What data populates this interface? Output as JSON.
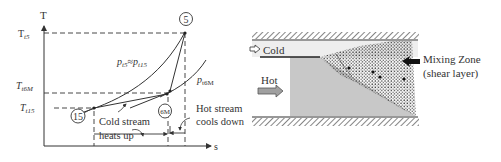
{
  "ts_diagram": {
    "axis_y_label": "T",
    "axis_x_label": "s",
    "tick_labels": {
      "t5_main": "T",
      "t5_sub": "t5",
      "t6m_main": "T",
      "t6m_sub": "t6M",
      "t15_main": "T",
      "t15_sub": "t15"
    },
    "state_points": {
      "p5": "5",
      "p6m": "6M",
      "p15": "15"
    },
    "isobar_labels": {
      "main_p1": "p",
      "main_sub1": "t5",
      "approx": "≈",
      "main_p2": "p",
      "main_sub2": "t15",
      "mix_p": "p",
      "mix_sub": "t6M"
    },
    "annotations": {
      "cold_line1": "Cold stream",
      "cold_line2": "heats up",
      "hot_line1": "Hot stream",
      "hot_line2": "cools down"
    }
  },
  "mixer_diagram": {
    "cold_label": "Cold",
    "hot_label": "Hot",
    "zone_label_line1": "Mixing Zone",
    "zone_label_line2": "(shear layer)"
  },
  "colors": {
    "line": "#333333",
    "hot_fill": "#c8c8c8",
    "cold_fill": "#eeeeee",
    "arrow_fill": "#a0a0a0",
    "hatch": "#444444"
  }
}
